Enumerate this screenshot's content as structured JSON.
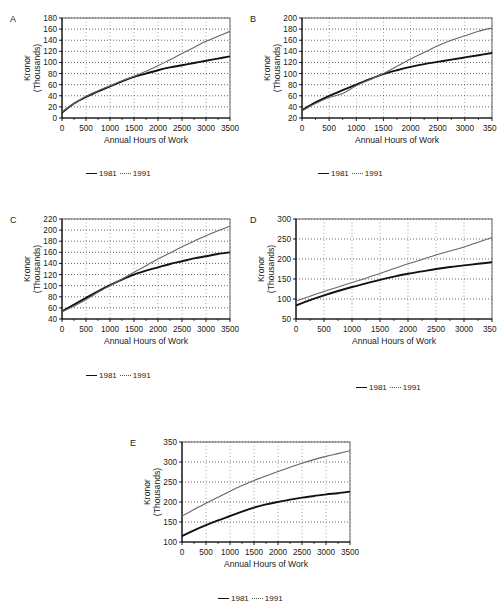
{
  "figure": {
    "background": "#ffffff",
    "series_colors": {
      "y1981": "#111111",
      "y1991": "#666666"
    },
    "legend": {
      "item_1981": "1981",
      "item_1991": "1991",
      "swatch_1981": "solid-line-swatch",
      "swatch_1991": "dotted-line-swatch"
    },
    "common": {
      "xlabel": "Annual Hours of Work",
      "ylabel_line1": "Kronor",
      "ylabel_line2": "(Thousands)",
      "xticks": [
        "0",
        "500",
        "1000",
        "1500",
        "2000",
        "2500",
        "3000",
        "3500"
      ]
    }
  },
  "chart_data": [
    {
      "id": "A",
      "panel_letter": "A",
      "type": "line",
      "title": "",
      "xlabel": "Annual Hours of Work",
      "ylabel": "Kronor (Thousands)",
      "xlim": [
        0,
        3500
      ],
      "ylim": [
        0,
        180
      ],
      "ytick_step": 20,
      "yticks": [
        "0",
        "20",
        "40",
        "60",
        "80",
        "100",
        "120",
        "140",
        "160",
        "180"
      ],
      "xticks": [
        "0",
        "500",
        "1000",
        "1500",
        "2000",
        "2500",
        "3000",
        "3500"
      ],
      "xtick_last_clipped": false,
      "grid": true,
      "legend_position": "below",
      "x": [
        0,
        250,
        500,
        750,
        1000,
        1250,
        1500,
        1750,
        2000,
        2250,
        2500,
        2750,
        3000,
        3250,
        3500
      ],
      "series": [
        {
          "name": "1981",
          "style": "solid",
          "values": [
            10,
            26,
            38,
            48,
            57,
            66,
            74,
            80,
            86,
            91,
            95,
            99,
            103,
            107,
            111
          ]
        },
        {
          "name": "1991",
          "style": "dotted",
          "values": [
            11,
            26,
            39,
            49,
            58,
            67,
            75,
            84,
            94,
            105,
            116,
            127,
            138,
            147,
            156
          ]
        }
      ]
    },
    {
      "id": "B",
      "panel_letter": "B",
      "type": "line",
      "title": "",
      "xlabel": "Annual Hours of Work",
      "ylabel": "Kronor (Thousands)",
      "xlim": [
        0,
        3500
      ],
      "ylim": [
        20,
        200
      ],
      "ytick_step": 20,
      "yticks": [
        "20",
        "40",
        "60",
        "80",
        "100",
        "120",
        "140",
        "160",
        "180",
        "200"
      ],
      "xticks": [
        "0",
        "500",
        "1000",
        "1500",
        "2000",
        "2500",
        "3000",
        "350"
      ],
      "xtick_last_clipped": true,
      "grid": true,
      "legend_position": "below",
      "x": [
        0,
        250,
        500,
        750,
        1000,
        1250,
        1500,
        1750,
        2000,
        2250,
        2500,
        2750,
        3000,
        3250,
        3500
      ],
      "series": [
        {
          "name": "1981",
          "style": "solid",
          "values": [
            34,
            48,
            60,
            70,
            80,
            90,
            99,
            106,
            112,
            117,
            121,
            125,
            129,
            133,
            137
          ]
        },
        {
          "name": "1991",
          "style": "dotted",
          "values": [
            33,
            46,
            57,
            64,
            78,
            89,
            100,
            113,
            126,
            138,
            150,
            160,
            168,
            176,
            182
          ]
        }
      ]
    },
    {
      "id": "C",
      "panel_letter": "C",
      "type": "line",
      "title": "",
      "xlabel": "Annual Hours of Work",
      "ylabel": "Kronor (Thousands)",
      "xlim": [
        0,
        3500
      ],
      "ylim": [
        40,
        220
      ],
      "ytick_step": 20,
      "yticks": [
        "40",
        "60",
        "80",
        "100",
        "120",
        "140",
        "160",
        "180",
        "200",
        "220"
      ],
      "xticks": [
        "0",
        "500",
        "1000",
        "1500",
        "2000",
        "2500",
        "3000",
        "3500"
      ],
      "xtick_last_clipped": false,
      "grid": true,
      "legend_position": "below",
      "x": [
        0,
        250,
        500,
        750,
        1000,
        1250,
        1500,
        1750,
        2000,
        2250,
        2500,
        2750,
        3000,
        3250,
        3500
      ],
      "series": [
        {
          "name": "1981",
          "style": "solid",
          "values": [
            54,
            66,
            78,
            90,
            101,
            111,
            120,
            127,
            133,
            139,
            144,
            149,
            153,
            157,
            160
          ]
        },
        {
          "name": "1991",
          "style": "dotted",
          "values": [
            53,
            63,
            75,
            88,
            100,
            112,
            124,
            136,
            148,
            159,
            170,
            180,
            190,
            199,
            207
          ]
        }
      ]
    },
    {
      "id": "D",
      "panel_letter": "D",
      "type": "line",
      "title": "",
      "xlabel": "Annual Hours of Work",
      "ylabel": "Kronor (Thousands)",
      "xlim": [
        0,
        3500
      ],
      "ylim": [
        50,
        300
      ],
      "ytick_step": 50,
      "yticks": [
        "50",
        "100",
        "150",
        "200",
        "250",
        "300"
      ],
      "xticks": [
        "0",
        "500",
        "1000",
        "1500",
        "2000",
        "2500",
        "3000",
        "350"
      ],
      "xtick_last_clipped": true,
      "grid": true,
      "legend_position": "below",
      "x": [
        0,
        250,
        500,
        750,
        1000,
        1250,
        1500,
        1750,
        2000,
        2250,
        2500,
        2750,
        3000,
        3250,
        3500
      ],
      "series": [
        {
          "name": "1981",
          "style": "solid",
          "values": [
            84,
            97,
            109,
            120,
            130,
            139,
            148,
            156,
            163,
            169,
            175,
            180,
            184,
            188,
            192
          ]
        },
        {
          "name": "1991",
          "style": "dotted",
          "values": [
            95,
            107,
            119,
            130,
            141,
            152,
            164,
            176,
            188,
            199,
            210,
            220,
            230,
            242,
            254
          ]
        }
      ]
    },
    {
      "id": "E",
      "panel_letter": "E",
      "type": "line",
      "title": "",
      "xlabel": "Annual Hours of Work",
      "ylabel": "Kronor (Thousands)",
      "xlim": [
        0,
        3500
      ],
      "ylim": [
        100,
        350
      ],
      "ytick_step": 50,
      "yticks": [
        "100",
        "150",
        "200",
        "250",
        "300",
        "350"
      ],
      "xticks": [
        "0",
        "500",
        "1000",
        "1500",
        "2000",
        "2500",
        "3000",
        "3500"
      ],
      "xtick_last_clipped": false,
      "grid": true,
      "legend_position": "below",
      "x": [
        0,
        250,
        500,
        750,
        1000,
        1250,
        1500,
        1750,
        2000,
        2250,
        2500,
        2750,
        3000,
        3250,
        3500
      ],
      "series": [
        {
          "name": "1981",
          "style": "solid",
          "values": [
            115,
            129,
            142,
            154,
            165,
            176,
            186,
            194,
            200,
            206,
            211,
            215,
            219,
            222,
            226
          ]
        },
        {
          "name": "1991",
          "style": "dotted",
          "values": [
            165,
            181,
            197,
            212,
            227,
            241,
            254,
            265,
            276,
            287,
            297,
            306,
            314,
            321,
            328
          ]
        }
      ]
    }
  ],
  "panels": [
    {
      "id": "A",
      "left": 8,
      "top": 4,
      "width": 232,
      "height": 150,
      "plot_left": 54,
      "plot_top": 14,
      "plot_width": 168,
      "plot_height": 100,
      "legend_left": 78,
      "legend_top": 165
    },
    {
      "id": "B",
      "left": 248,
      "top": 4,
      "width": 249,
      "height": 150,
      "plot_left": 54,
      "plot_top": 14,
      "plot_width": 190,
      "plot_height": 100,
      "legend_left": 70,
      "legend_top": 165
    },
    {
      "id": "C",
      "left": 8,
      "top": 205,
      "width": 232,
      "height": 150,
      "plot_left": 54,
      "plot_top": 14,
      "plot_width": 168,
      "plot_height": 100,
      "legend_left": 78,
      "legend_top": 166
    },
    {
      "id": "D",
      "left": 248,
      "top": 205,
      "width": 249,
      "height": 150,
      "plot_left": 48,
      "plot_top": 14,
      "plot_width": 196,
      "plot_height": 100,
      "legend_left": 108,
      "legend_top": 178
    },
    {
      "id": "E",
      "left": 128,
      "top": 428,
      "width": 232,
      "height": 150,
      "plot_left": 54,
      "plot_top": 14,
      "plot_width": 168,
      "plot_height": 100,
      "legend_left": 90,
      "legend_top": 166
    }
  ]
}
